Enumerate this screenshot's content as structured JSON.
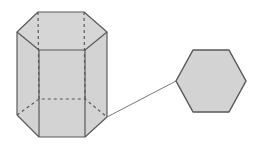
{
  "diagram": {
    "colors": {
      "fill": "#d3d3d3",
      "stroke": "#5a5a5a",
      "background": "#ffffff"
    },
    "prism": {
      "top_face": [
        [
          38,
          12
        ],
        [
          84,
          12
        ],
        [
          107,
          32
        ],
        [
          85,
          50
        ],
        [
          39,
          50
        ],
        [
          17,
          32
        ]
      ],
      "bottom_visible": [
        [
          17,
          115
        ],
        [
          39,
          137
        ],
        [
          85,
          137
        ],
        [
          107,
          117
        ]
      ],
      "bottom_hidden": [
        [
          17,
          115
        ],
        [
          39,
          99
        ],
        [
          85,
          99
        ],
        [
          107,
          117
        ]
      ]
    },
    "hexagon": {
      "points": [
        [
          193,
          50
        ],
        [
          229,
          50
        ],
        [
          246,
          81
        ],
        [
          229,
          112
        ],
        [
          193,
          112
        ],
        [
          176,
          81
        ]
      ]
    },
    "connector": {
      "from": [
        107,
        117
      ],
      "to": [
        176,
        81
      ]
    }
  }
}
